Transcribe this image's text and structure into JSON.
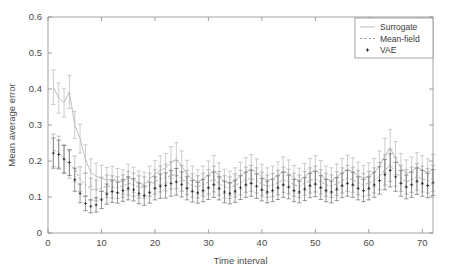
{
  "figure": {
    "background_color": "#ffffff",
    "axes_color": "#8c8c8c"
  },
  "chart_data": {
    "type": "line",
    "title": "",
    "xlabel": "Time interval",
    "ylabel": "Mean average error",
    "xlim": [
      0,
      72
    ],
    "ylim": [
      0,
      0.6
    ],
    "xticks": [
      0,
      10,
      20,
      30,
      40,
      50,
      60,
      70
    ],
    "xtick_labels": [
      "0",
      "10",
      "20",
      "30",
      "40",
      "50",
      "60",
      "70"
    ],
    "yticks": [
      0,
      0.1,
      0.2,
      0.3,
      0.4,
      0.5,
      0.6
    ],
    "ytick_labels": [
      "0",
      "0.1",
      "0.2",
      "0.3",
      "0.4",
      "0.5",
      "0.6"
    ],
    "grid": false,
    "error_bars": true,
    "legend": {
      "position": "top-right",
      "border": true,
      "entries": [
        {
          "label": "Surrogate",
          "marker": "solid-line",
          "color": "#b0b0b0"
        },
        {
          "label": "Mean-field",
          "marker": "dashed-line",
          "color": "#9a9a9a"
        },
        {
          "label": "VAE",
          "marker": "plus-point",
          "color": "#2b2b2b"
        }
      ]
    },
    "x": [
      1,
      2,
      3,
      4,
      5,
      6,
      7,
      8,
      9,
      10,
      11,
      12,
      13,
      14,
      15,
      16,
      17,
      18,
      19,
      20,
      21,
      22,
      23,
      24,
      25,
      26,
      27,
      28,
      29,
      30,
      31,
      32,
      33,
      34,
      35,
      36,
      37,
      38,
      39,
      40,
      41,
      42,
      43,
      44,
      45,
      46,
      47,
      48,
      49,
      50,
      51,
      52,
      53,
      54,
      55,
      56,
      57,
      58,
      59,
      60,
      61,
      62,
      63,
      64,
      65,
      66,
      67,
      68,
      69,
      70,
      71,
      72
    ],
    "series": [
      {
        "name": "Surrogate",
        "color": "#b0b0b0",
        "style": "solid",
        "values": [
          0.405,
          0.375,
          0.362,
          0.392,
          0.3,
          0.262,
          0.205,
          0.168,
          0.158,
          0.152,
          0.147,
          0.15,
          0.145,
          0.142,
          0.155,
          0.148,
          0.138,
          0.135,
          0.15,
          0.163,
          0.175,
          0.18,
          0.196,
          0.205,
          0.186,
          0.164,
          0.15,
          0.142,
          0.15,
          0.162,
          0.175,
          0.158,
          0.143,
          0.138,
          0.146,
          0.158,
          0.17,
          0.178,
          0.168,
          0.155,
          0.146,
          0.15,
          0.16,
          0.172,
          0.165,
          0.152,
          0.145,
          0.156,
          0.168,
          0.175,
          0.163,
          0.15,
          0.146,
          0.155,
          0.168,
          0.176,
          0.17,
          0.16,
          0.152,
          0.158,
          0.168,
          0.186,
          0.215,
          0.236,
          0.208,
          0.18,
          0.165,
          0.172,
          0.182,
          0.175,
          0.168,
          0.178
        ],
        "errors": [
          0.048,
          0.042,
          0.04,
          0.046,
          0.038,
          0.04,
          0.04,
          0.038,
          0.036,
          0.036,
          0.035,
          0.035,
          0.034,
          0.034,
          0.036,
          0.035,
          0.034,
          0.034,
          0.036,
          0.038,
          0.04,
          0.041,
          0.044,
          0.046,
          0.042,
          0.038,
          0.036,
          0.034,
          0.036,
          0.038,
          0.04,
          0.037,
          0.034,
          0.034,
          0.035,
          0.038,
          0.039,
          0.04,
          0.038,
          0.036,
          0.035,
          0.036,
          0.038,
          0.039,
          0.038,
          0.036,
          0.035,
          0.037,
          0.039,
          0.04,
          0.038,
          0.036,
          0.035,
          0.037,
          0.039,
          0.04,
          0.039,
          0.037,
          0.036,
          0.037,
          0.039,
          0.042,
          0.048,
          0.052,
          0.046,
          0.041,
          0.038,
          0.039,
          0.041,
          0.04,
          0.038,
          0.04
        ]
      },
      {
        "name": "Mean-field",
        "color": "#9a9a9a",
        "style": "dashed",
        "values": [
          0.23,
          0.225,
          0.205,
          0.19,
          0.178,
          0.15,
          0.135,
          0.122,
          0.118,
          0.125,
          0.13,
          0.128,
          0.126,
          0.13,
          0.138,
          0.134,
          0.128,
          0.126,
          0.134,
          0.142,
          0.15,
          0.154,
          0.16,
          0.162,
          0.152,
          0.14,
          0.132,
          0.128,
          0.134,
          0.142,
          0.15,
          0.138,
          0.128,
          0.126,
          0.132,
          0.14,
          0.148,
          0.152,
          0.146,
          0.136,
          0.13,
          0.133,
          0.14,
          0.148,
          0.143,
          0.134,
          0.13,
          0.138,
          0.146,
          0.15,
          0.142,
          0.134,
          0.13,
          0.137,
          0.146,
          0.152,
          0.148,
          0.14,
          0.134,
          0.138,
          0.146,
          0.158,
          0.175,
          0.188,
          0.17,
          0.152,
          0.142,
          0.148,
          0.156,
          0.15,
          0.145,
          0.152
        ],
        "errors": [
          0.045,
          0.044,
          0.04,
          0.038,
          0.036,
          0.034,
          0.032,
          0.03,
          0.029,
          0.03,
          0.031,
          0.031,
          0.03,
          0.031,
          0.033,
          0.032,
          0.031,
          0.03,
          0.032,
          0.034,
          0.036,
          0.037,
          0.038,
          0.039,
          0.036,
          0.034,
          0.032,
          0.031,
          0.032,
          0.034,
          0.036,
          0.033,
          0.031,
          0.03,
          0.032,
          0.034,
          0.035,
          0.036,
          0.035,
          0.033,
          0.031,
          0.032,
          0.034,
          0.035,
          0.034,
          0.032,
          0.031,
          0.033,
          0.035,
          0.036,
          0.034,
          0.032,
          0.031,
          0.033,
          0.035,
          0.036,
          0.035,
          0.034,
          0.032,
          0.033,
          0.035,
          0.038,
          0.042,
          0.045,
          0.04,
          0.036,
          0.034,
          0.035,
          0.037,
          0.036,
          0.034,
          0.036
        ]
      },
      {
        "name": "VAE",
        "color": "#2b2b2b",
        "style": "points",
        "values": [
          0.222,
          0.218,
          0.205,
          0.196,
          0.148,
          0.11,
          0.082,
          0.074,
          0.078,
          0.092,
          0.108,
          0.115,
          0.112,
          0.118,
          0.124,
          0.12,
          0.11,
          0.104,
          0.112,
          0.124,
          0.13,
          0.132,
          0.138,
          0.142,
          0.135,
          0.124,
          0.116,
          0.112,
          0.118,
          0.126,
          0.134,
          0.124,
          0.114,
          0.11,
          0.116,
          0.126,
          0.134,
          0.138,
          0.13,
          0.12,
          0.114,
          0.118,
          0.126,
          0.134,
          0.128,
          0.118,
          0.114,
          0.122,
          0.132,
          0.136,
          0.126,
          0.118,
          0.114,
          0.122,
          0.132,
          0.138,
          0.134,
          0.124,
          0.118,
          0.124,
          0.134,
          0.146,
          0.162,
          0.174,
          0.156,
          0.138,
          0.128,
          0.134,
          0.144,
          0.138,
          0.132,
          0.14
        ],
        "errors": [
          0.042,
          0.04,
          0.038,
          0.036,
          0.032,
          0.026,
          0.02,
          0.018,
          0.02,
          0.024,
          0.028,
          0.03,
          0.029,
          0.03,
          0.032,
          0.031,
          0.029,
          0.027,
          0.029,
          0.032,
          0.034,
          0.035,
          0.036,
          0.037,
          0.035,
          0.032,
          0.03,
          0.029,
          0.031,
          0.033,
          0.035,
          0.032,
          0.03,
          0.029,
          0.031,
          0.033,
          0.035,
          0.036,
          0.034,
          0.031,
          0.03,
          0.031,
          0.033,
          0.035,
          0.033,
          0.031,
          0.03,
          0.032,
          0.034,
          0.035,
          0.033,
          0.031,
          0.03,
          0.032,
          0.034,
          0.036,
          0.035,
          0.032,
          0.031,
          0.032,
          0.035,
          0.038,
          0.042,
          0.046,
          0.04,
          0.036,
          0.033,
          0.035,
          0.037,
          0.036,
          0.034,
          0.036
        ]
      }
    ]
  }
}
